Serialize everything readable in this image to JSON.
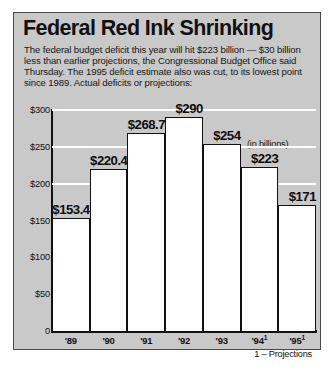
{
  "headline": "Federal Red Ink Shrinking",
  "deck": "The federal budget deficit this year will hit $223 billion — $30 billion less than earlier projections, the Congressional Budget Office said Thursday. The 1995 deficit estimate also was cut, to its lowest point since 1989. Actual deficits or projections:",
  "units_note": "(in billions)",
  "footnote": "1 – Projections",
  "colors": {
    "panel_background": "#c9c9c9",
    "page_background": "#ffffff",
    "bar_fill": "#ffffff",
    "bar_outline": "#111111",
    "gridline": "#ffffff",
    "text": "#111111"
  },
  "chart_data": {
    "type": "bar",
    "title": "Federal Red Ink Shrinking",
    "subtitle": "The federal budget deficit this year will hit $223 billion — $30 billion less than earlier projections, the Congressional Budget Office said Thursday. The 1995 deficit estimate also was cut, to its lowest point since 1989. Actual deficits or projections:",
    "xlabel": "",
    "ylabel": "(in billions)",
    "ylim": [
      0,
      300
    ],
    "grid": true,
    "legend": "none",
    "categories": [
      "'89",
      "'90",
      "'91",
      "'92",
      "'93",
      "'94",
      "'95"
    ],
    "category_labels": [
      "'89",
      "'90",
      "'91",
      "'92",
      "'93",
      "'94¹",
      "'95¹"
    ],
    "values": [
      153.4,
      220.4,
      268.7,
      290,
      254,
      223,
      171
    ],
    "value_labels": [
      "$153.4",
      "$220.4",
      "$268.7",
      "$290",
      "$254",
      "$223",
      "$171"
    ],
    "projected": [
      false,
      false,
      false,
      false,
      false,
      true,
      true
    ],
    "yticks": [
      0,
      50,
      100,
      150,
      200,
      250,
      300
    ],
    "ytick_labels": [
      "0",
      "$50",
      "$100",
      "$150",
      "$200",
      "$250",
      "$300"
    ],
    "annotations": [
      "(in billions)",
      "1 – Projections"
    ]
  }
}
